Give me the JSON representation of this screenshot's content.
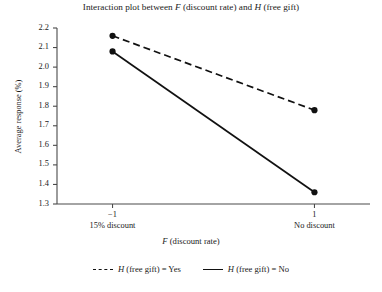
{
  "chart_data": {
    "type": "line",
    "title": "Interaction plot between F (discount rate) and H (free gift)",
    "title_parts": {
      "seg1": "Interaction plot between ",
      "var1": "F",
      "seg2": " (discount rate) and ",
      "var2": "H",
      "seg3": " (free gift)"
    },
    "xlabel": "F (discount rate)",
    "xlabel_parts": {
      "var": "F",
      "rest": " (discount rate)"
    },
    "ylabel": "Average response (%)",
    "x": [
      -1,
      1
    ],
    "xtick_labels": [
      "−1",
      "1"
    ],
    "xtick_sublabels": [
      "15% discount",
      "No discount"
    ],
    "ytick_labels": [
      "2.2",
      "2.1",
      "2.0",
      "1.9",
      "1.8",
      "1.7",
      "1.6",
      "1.5",
      "1.4",
      "1.3"
    ],
    "ylim": [
      1.3,
      2.2
    ],
    "xlim": [
      -1.55,
      1.55
    ],
    "grid": false,
    "legend_position": "bottom",
    "series": [
      {
        "name": "H (free gift) = Yes",
        "name_parts": {
          "var": "H",
          "rest": " (free gift) = Yes"
        },
        "linestyle": "dashed",
        "color": "#111111",
        "values": [
          2.16,
          1.78
        ]
      },
      {
        "name": "H (free gift) = No",
        "name_parts": {
          "var": "H",
          "rest": " (free gift) = No"
        },
        "linestyle": "solid",
        "color": "#111111",
        "values": [
          2.08,
          1.36
        ]
      }
    ]
  },
  "axis": {
    "tick_color": "#4a4a4a",
    "line_color": "#4a4a4a"
  }
}
